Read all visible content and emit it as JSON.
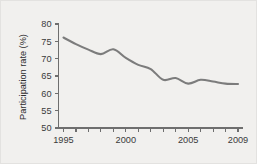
{
  "chart_data": {
    "type": "line",
    "title": "",
    "xlabel": "",
    "ylabel": "Participation rate (%)",
    "xlim": [
      1994.6,
      2009.4
    ],
    "ylim": [
      50,
      80
    ],
    "grid": false,
    "legend": null,
    "line_color": "#7c7c7c",
    "background_color": "#f1f0ee",
    "axis_color": "#6e6e6e",
    "x": [
      1995,
      1996,
      1997,
      1998,
      1999,
      2000,
      2001,
      2002,
      2003,
      2004,
      2005,
      2006,
      2007,
      2008,
      2009
    ],
    "values": [
      76.1,
      74.2,
      72.6,
      71.3,
      72.7,
      70.2,
      68.2,
      67.0,
      63.9,
      64.4,
      62.8,
      63.9,
      63.4,
      62.8,
      62.7
    ],
    "series": [
      {
        "name": "Participation rate",
        "values": [
          76.1,
          74.2,
          72.6,
          71.3,
          72.7,
          70.2,
          68.2,
          67.0,
          63.9,
          64.4,
          62.8,
          63.9,
          63.4,
          62.8,
          62.7
        ]
      }
    ],
    "y_ticks": [
      50,
      55,
      60,
      65,
      70,
      75,
      80
    ],
    "y_tick_labels": [
      "50",
      "55",
      "60",
      "65",
      "70",
      "75",
      "80"
    ],
    "x_ticks": [
      1995,
      1996,
      1997,
      1998,
      1999,
      2000,
      2001,
      2002,
      2003,
      2004,
      2005,
      2006,
      2007,
      2008,
      2009
    ],
    "x_tick_labels_shown": [
      {
        "value": 1995,
        "label": "1995"
      },
      {
        "value": 2000,
        "label": "2000"
      },
      {
        "value": 2005,
        "label": "2005"
      },
      {
        "value": 2009,
        "label": "2009"
      }
    ]
  }
}
